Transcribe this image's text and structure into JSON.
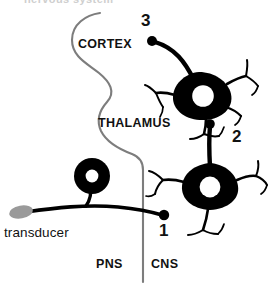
{
  "figure": {
    "title_clipped": "nervous system",
    "colors": {
      "ink": "#111111",
      "neuron_fill": "#000000",
      "boundary_line": "#7d7d7d",
      "transducer_fill": "#9a9a9a",
      "background": "#ffffff"
    }
  },
  "regions": [
    {
      "id": "cortex",
      "label": "CORTEX",
      "x": 78,
      "y": 38
    },
    {
      "id": "thalamus",
      "label": "THALAMUS",
      "x": 98,
      "y": 117
    }
  ],
  "sides": [
    {
      "id": "pns",
      "label": "PNS",
      "x": 96,
      "y": 258
    },
    {
      "id": "cns",
      "label": "CNS",
      "x": 151,
      "y": 258
    }
  ],
  "neurons": [
    {
      "id": "neuron-1",
      "order_label": "1",
      "label_x": 159,
      "label_y": 222,
      "soma_shape": "ring",
      "role": "first-order primary sensory neuron",
      "location": "PNS",
      "has_terminal_dot": true
    },
    {
      "id": "neuron-2",
      "order_label": "2",
      "label_x": 232,
      "label_y": 128,
      "soma_shape": "multipolar",
      "role": "second-order neuron",
      "location": "CNS",
      "has_terminal_dot": true
    },
    {
      "id": "neuron-3",
      "order_label": "3",
      "label_x": 141,
      "label_y": 12,
      "soma_shape": "multipolar",
      "role": "third-order neuron",
      "location": "CNS",
      "has_terminal_dot": true
    }
  ],
  "transducer": {
    "label": "transducer",
    "label_x": 4,
    "label_y": 226,
    "ellipse_cx": 21,
    "ellipse_cy": 212
  }
}
